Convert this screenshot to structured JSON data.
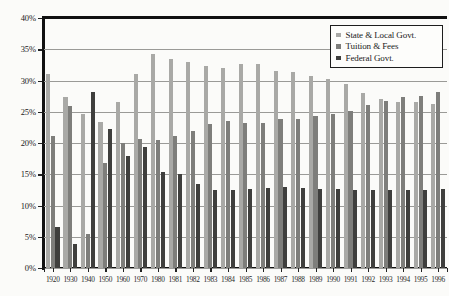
{
  "chart_data": {
    "type": "bar",
    "title": "",
    "subtitle": "",
    "xlabel": "",
    "ylabel": "",
    "ylim": [
      0,
      40
    ],
    "ytick_step": 5,
    "ytick_labels": [
      "40%",
      "35%",
      "30%",
      "25%",
      "20%",
      "15%",
      "10%",
      "5%",
      "0%"
    ],
    "ytick_values": [
      40,
      35,
      30,
      25,
      20,
      15,
      10,
      5,
      0
    ],
    "grid": true,
    "grid_axis": "y",
    "legend_position": "top-right",
    "value_unit": "percent",
    "categories": [
      "1920",
      "1930",
      "1940",
      "1950",
      "1960",
      "1970",
      "1980",
      "1981",
      "1982",
      "1983",
      "1984",
      "1985",
      "1986",
      "1987",
      "1988",
      "1989",
      "1990",
      "1991",
      "1992",
      "1993",
      "1994",
      "1995",
      "1996"
    ],
    "series": [
      {
        "name": "State & Local Govt.",
        "color": "#a9a9a6",
        "values": [
          31.0,
          27.3,
          24.6,
          23.4,
          26.5,
          31.0,
          34.2,
          33.5,
          33.0,
          32.4,
          32.0,
          32.6,
          32.6,
          31.6,
          31.3,
          30.8,
          30.3,
          29.4,
          28.0,
          27.1,
          26.6,
          26.6,
          26.3
        ]
      },
      {
        "name": "Tuition & Fees",
        "color": "#7e7e7b",
        "values": [
          21.2,
          25.9,
          5.4,
          16.8,
          20.0,
          20.6,
          20.5,
          21.1,
          22.0,
          23.1,
          23.6,
          23.2,
          23.2,
          23.9,
          23.9,
          24.3,
          24.6,
          25.2,
          26.1,
          26.8,
          27.3,
          27.5,
          28.1
        ]
      },
      {
        "name": "Federal Govt.",
        "color": "#3f3f3d",
        "values": [
          6.5,
          3.9,
          28.2,
          22.2,
          18.0,
          19.3,
          15.3,
          15.1,
          13.5,
          12.5,
          12.5,
          12.6,
          12.8,
          13.0,
          12.8,
          12.7,
          12.6,
          12.5,
          12.5,
          12.5,
          12.5,
          12.5,
          12.6
        ]
      }
    ]
  },
  "legend": {
    "entries": [
      {
        "label": "State & Local Govt."
      },
      {
        "label": "Tuition & Fees"
      },
      {
        "label": "Federal Govt."
      }
    ]
  }
}
